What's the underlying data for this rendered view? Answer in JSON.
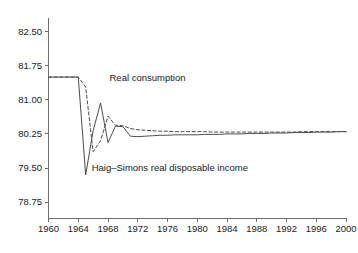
{
  "chart_data": {
    "type": "line",
    "title": "",
    "subtitle": "",
    "xlabel": "",
    "ylabel": "",
    "xlim": [
      1960,
      2000
    ],
    "ylim": [
      78.4,
      82.8
    ],
    "grid": false,
    "legend_position": "inline-annotations",
    "x_ticks": [
      "1960",
      "1964",
      "1968",
      "1972",
      "1976",
      "1980",
      "1984",
      "1988",
      "1992",
      "1996",
      "2000"
    ],
    "x_tick_values": [
      1960,
      1964,
      1968,
      1972,
      1976,
      1980,
      1984,
      1988,
      1992,
      1996,
      2000
    ],
    "y_ticks": [
      "78.75",
      "79.50",
      "80.25",
      "81.00",
      "81.75",
      "82.50"
    ],
    "y_tick_values": [
      78.75,
      79.5,
      80.25,
      81.0,
      81.75,
      82.5
    ],
    "x": [
      1960,
      1961,
      1962,
      1963,
      1964,
      1965,
      1966,
      1967,
      1968,
      1969,
      1970,
      1971,
      1972,
      1973,
      1974,
      1975,
      1976,
      1977,
      1978,
      1979,
      1980,
      1981,
      1982,
      1983,
      1984,
      1985,
      1986,
      1987,
      1988,
      1989,
      1990,
      1991,
      1992,
      1993,
      1994,
      1995,
      1996,
      1997,
      1998,
      1999,
      2000
    ],
    "series": [
      {
        "name": "Haig–Simons real disposable income",
        "style": "solid",
        "color": "#4d4d4d",
        "values": [
          81.5,
          81.5,
          81.5,
          81.5,
          81.5,
          79.35,
          80.32,
          80.93,
          80.06,
          80.42,
          80.41,
          80.2,
          80.19,
          80.2,
          80.21,
          80.22,
          80.22,
          80.23,
          80.23,
          80.23,
          80.23,
          80.24,
          80.24,
          80.24,
          80.25,
          80.25,
          80.25,
          80.26,
          80.26,
          80.26,
          80.27,
          80.27,
          80.27,
          80.28,
          80.28,
          80.28,
          80.29,
          80.29,
          80.29,
          80.3,
          80.3
        ]
      },
      {
        "name": "Real consumption",
        "style": "dashed",
        "color": "#4d4d4d",
        "values": [
          81.5,
          81.5,
          81.5,
          81.5,
          81.5,
          81.28,
          79.86,
          80.1,
          80.64,
          80.44,
          80.43,
          80.37,
          80.34,
          80.33,
          80.32,
          80.31,
          80.31,
          80.3,
          80.3,
          80.3,
          80.3,
          80.3,
          80.29,
          80.29,
          80.29,
          80.29,
          80.29,
          80.29,
          80.29,
          80.29,
          80.29,
          80.29,
          80.29,
          80.29,
          80.3,
          80.3,
          80.3,
          80.3,
          80.3,
          80.3,
          80.3
        ]
      }
    ],
    "annotations": [
      {
        "text": "Real consumption",
        "x": 1968.2,
        "y": 81.42,
        "series": "Real consumption"
      },
      {
        "text": "Haig–Simons real disposable income",
        "x": 1965.8,
        "y": 79.43,
        "series": "Haig–Simons real disposable income"
      }
    ]
  },
  "axes": {
    "y_axis_name": "value-axis",
    "x_axis_name": "year-axis"
  },
  "colors": {
    "axis": "#6e6e6e",
    "line": "#4d4d4d",
    "text": "#1a1a1a",
    "background": "#ffffff"
  }
}
